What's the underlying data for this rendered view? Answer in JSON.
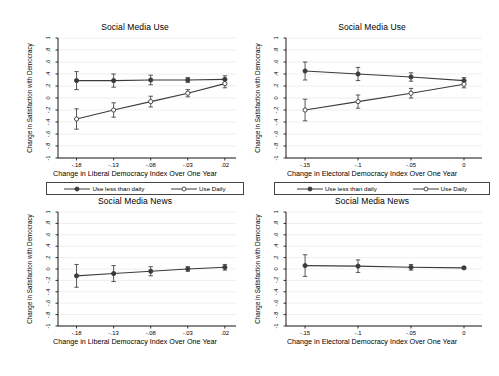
{
  "figure": {
    "width": 499,
    "height": 376,
    "background": "#ffffff",
    "axis_color": "#000000",
    "grid_color": "#e8e8e8",
    "series_color": "#3b3b3b"
  },
  "chart_data": [
    {
      "id": "top-left",
      "type": "line",
      "title": "Social Media Use",
      "xlabel": "Change in Liberal Democracy Index Over One Year",
      "ylabel": "Change in Satisfaction with Democracy",
      "xlim": [
        -0.205,
        0.035
      ],
      "ylim": [
        -1,
        1
      ],
      "xticks": [
        -0.18,
        -0.13,
        -0.08,
        -0.03,
        0.02
      ],
      "xtick_labels": [
        "-.18",
        "-.13",
        "-.08",
        "-.03",
        ".02"
      ],
      "yticks": [
        -1,
        -0.8,
        -0.6,
        -0.4,
        -0.2,
        0,
        0.2,
        0.4,
        0.6,
        0.8,
        1
      ],
      "ytick_labels": [
        "-1",
        "-.8",
        "-.6",
        "-.4",
        "-.2",
        "0",
        ".2",
        ".4",
        ".6",
        ".8",
        "1"
      ],
      "grid": true,
      "legend": true,
      "legend_position": "below",
      "series": [
        {
          "name": "Use less than daily",
          "marker": "filled-circle",
          "x": [
            -0.18,
            -0.13,
            -0.08,
            -0.03,
            0.02
          ],
          "values": [
            0.29,
            0.29,
            0.3,
            0.3,
            0.31
          ],
          "ci_low": [
            0.14,
            0.18,
            0.22,
            0.26,
            0.25
          ],
          "ci_high": [
            0.44,
            0.4,
            0.38,
            0.34,
            0.37
          ]
        },
        {
          "name": "Use Daily",
          "marker": "hollow-circle",
          "x": [
            -0.18,
            -0.13,
            -0.08,
            -0.03,
            0.02
          ],
          "values": [
            -0.35,
            -0.2,
            -0.06,
            0.08,
            0.24
          ],
          "ci_low": [
            -0.52,
            -0.32,
            -0.15,
            0.02,
            0.17
          ],
          "ci_high": [
            -0.18,
            -0.08,
            0.03,
            0.14,
            0.31
          ]
        }
      ]
    },
    {
      "id": "top-right",
      "type": "line",
      "title": "Social Media Use",
      "xlabel": "Change in Electoral Democracy Index Over One Year",
      "ylabel": "Change in Satisfaction with Democracy",
      "xlim": [
        -0.168,
        0.017
      ],
      "ylim": [
        -1,
        1
      ],
      "xticks": [
        -0.15,
        -0.1,
        -0.05,
        0
      ],
      "xtick_labels": [
        "-.15",
        "-.1",
        "-.05",
        "0"
      ],
      "yticks": [
        -1,
        -0.8,
        -0.6,
        -0.4,
        -0.2,
        0,
        0.2,
        0.4,
        0.6,
        0.8,
        1
      ],
      "ytick_labels": [
        "-1",
        "-.8",
        "-.6",
        "-.4",
        "-.2",
        "0",
        ".2",
        ".4",
        ".6",
        ".8",
        "1"
      ],
      "grid": true,
      "legend": true,
      "legend_position": "below",
      "series": [
        {
          "name": "Use less than daily",
          "marker": "filled-circle",
          "x": [
            -0.15,
            -0.1,
            -0.05,
            0
          ],
          "values": [
            0.45,
            0.4,
            0.35,
            0.29
          ],
          "ci_low": [
            0.3,
            0.29,
            0.28,
            0.24
          ],
          "ci_high": [
            0.6,
            0.51,
            0.42,
            0.34
          ]
        },
        {
          "name": "Use Daily",
          "marker": "hollow-circle",
          "x": [
            -0.15,
            -0.1,
            -0.05,
            0
          ],
          "values": [
            -0.2,
            -0.06,
            0.08,
            0.23
          ],
          "ci_low": [
            -0.38,
            -0.17,
            0.0,
            0.17
          ],
          "ci_high": [
            -0.02,
            0.05,
            0.16,
            0.29
          ]
        }
      ]
    },
    {
      "id": "bottom-left",
      "type": "line",
      "title": "Social Media News",
      "xlabel": "Change in Liberal Democracy Index Over One Year",
      "ylabel": "Change in Satisfaction with Democracy",
      "xlim": [
        -0.205,
        0.035
      ],
      "ylim": [
        -1,
        1
      ],
      "xticks": [
        -0.18,
        -0.13,
        -0.08,
        -0.03,
        0.02
      ],
      "xtick_labels": [
        "-.18",
        "-.13",
        "-.08",
        "-.03",
        ".02"
      ],
      "yticks": [
        -1,
        -0.8,
        -0.6,
        -0.4,
        -0.2,
        0,
        0.2,
        0.4,
        0.6,
        0.8,
        1
      ],
      "ytick_labels": [
        "-1",
        "-.8",
        "-.6",
        "-.4",
        "-.2",
        "0",
        ".2",
        ".4",
        ".6",
        ".8",
        "1"
      ],
      "grid": true,
      "legend": false,
      "series": [
        {
          "name": "Social Media News",
          "marker": "filled-circle",
          "x": [
            -0.18,
            -0.13,
            -0.08,
            -0.03,
            0.02
          ],
          "values": [
            -0.12,
            -0.08,
            -0.04,
            0.0,
            0.03
          ],
          "ci_low": [
            -0.32,
            -0.22,
            -0.12,
            -0.04,
            -0.02
          ],
          "ci_high": [
            0.08,
            0.06,
            0.04,
            0.04,
            0.08
          ]
        }
      ]
    },
    {
      "id": "bottom-right",
      "type": "line",
      "title": "Social Media News",
      "xlabel": "Change in Electoral Democracy Index Over One Year",
      "ylabel": "Change in Satisfaction with Democracy",
      "xlim": [
        -0.168,
        0.017
      ],
      "ylim": [
        -1,
        1
      ],
      "xticks": [
        -0.15,
        -0.1,
        -0.05,
        0
      ],
      "xtick_labels": [
        "-.15",
        "-.1",
        "-.05",
        "0"
      ],
      "yticks": [
        -1,
        -0.8,
        -0.6,
        -0.4,
        -0.2,
        0,
        0.2,
        0.4,
        0.6,
        0.8,
        1
      ],
      "ytick_labels": [
        "-1",
        "-.8",
        "-.6",
        "-.4",
        "-.2",
        "0",
        ".2",
        ".4",
        ".6",
        ".8",
        "1"
      ],
      "grid": true,
      "legend": false,
      "series": [
        {
          "name": "Social Media News",
          "marker": "filled-circle",
          "x": [
            -0.15,
            -0.1,
            -0.05,
            0
          ],
          "values": [
            0.06,
            0.05,
            0.03,
            0.02
          ],
          "ci_low": [
            -0.13,
            -0.06,
            -0.02,
            0.0
          ],
          "ci_high": [
            0.25,
            0.16,
            0.08,
            0.04
          ]
        }
      ]
    }
  ],
  "legend": {
    "entries": [
      {
        "label": "Use less than daily",
        "marker": "filled-circle"
      },
      {
        "label": "Use Daily",
        "marker": "hollow-circle"
      }
    ]
  }
}
